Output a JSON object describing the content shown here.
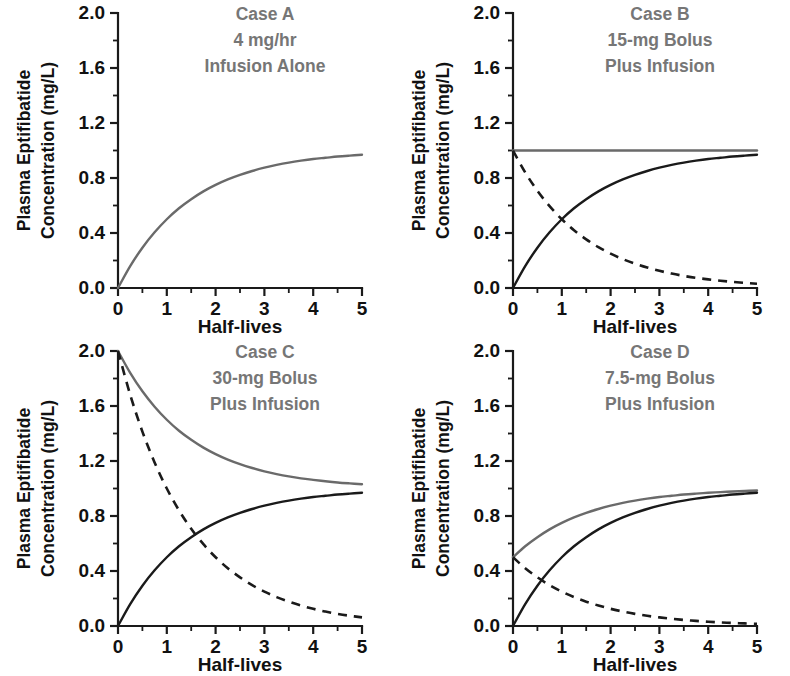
{
  "figure": {
    "width": 790,
    "height": 676,
    "background": "#ffffff",
    "panel_order": [
      "A",
      "B",
      "C",
      "D"
    ]
  },
  "style": {
    "total_color": "#6a6a6a",
    "infusion_color": "#1a1a1a",
    "bolus_color": "#1a1a1a",
    "axis_color": "#1a1a1a",
    "title_color": "#767676",
    "label_color": "#111111"
  },
  "axes": {
    "xlabel": "Half-lives",
    "ylabel_line1": "Plasma Eptifibatide",
    "ylabel_line2": "Concentration (mg/L)",
    "xlim": [
      0,
      5
    ],
    "ylim": [
      0,
      2.0
    ],
    "x_major_ticks": [
      0,
      1,
      2,
      3,
      4,
      5
    ],
    "x_tick_labels": [
      "0",
      "1",
      "2",
      "3",
      "4",
      "5"
    ],
    "x_minor_ticks": [
      0.5,
      1.5,
      2.5,
      3.5,
      4.5
    ],
    "y_major_ticks": [
      0.0,
      0.4,
      0.8,
      1.2,
      1.6,
      2.0
    ],
    "y_tick_labels": [
      "0.0",
      "0.4",
      "0.8",
      "1.2",
      "1.6",
      "2.0"
    ],
    "y_minor_ticks": [
      0.2,
      0.6,
      1.0,
      1.4,
      1.8
    ],
    "grid": false
  },
  "chart_data": [
    {
      "type": "line",
      "panel": "A",
      "title_lines": [
        "Case A",
        "4 mg/hr",
        "Infusion Alone"
      ],
      "xlabel": "Half-lives",
      "ylabel": "Plasma Eptifibatide Concentration (mg/L)",
      "xlim": [
        0,
        5
      ],
      "ylim": [
        0,
        2.0
      ],
      "grid": false,
      "legend": "none",
      "bolus_dose_mg": 0,
      "infusion_rate": "4 mg/hr",
      "steady_state": 1.0,
      "x": [
        0,
        0.25,
        0.5,
        0.75,
        1,
        1.25,
        1.5,
        1.75,
        2,
        2.25,
        2.5,
        2.75,
        3,
        3.25,
        3.5,
        3.75,
        4,
        4.25,
        4.5,
        4.75,
        5
      ],
      "series": [
        {
          "name": "Total plasma concentration",
          "style": "solid-gray",
          "color": "#6a6a6a",
          "values": [
            0.0,
            0.159,
            0.293,
            0.405,
            0.5,
            0.58,
            0.646,
            0.703,
            0.75,
            0.79,
            0.823,
            0.851,
            0.875,
            0.895,
            0.912,
            0.926,
            0.938,
            0.947,
            0.956,
            0.963,
            0.969
          ]
        }
      ]
    },
    {
      "type": "line",
      "panel": "B",
      "title_lines": [
        "Case B",
        "15-mg Bolus",
        "Plus Infusion"
      ],
      "xlabel": "Half-lives",
      "ylabel": "Plasma Eptifibatide Concentration (mg/L)",
      "xlim": [
        0,
        5
      ],
      "ylim": [
        0,
        2.0
      ],
      "grid": false,
      "legend": "none",
      "bolus_dose_mg": 15,
      "infusion_rate": "4 mg/hr",
      "steady_state": 1.0,
      "x": [
        0,
        0.25,
        0.5,
        0.75,
        1,
        1.25,
        1.5,
        1.75,
        2,
        2.25,
        2.5,
        2.75,
        3,
        3.25,
        3.5,
        3.75,
        4,
        4.25,
        4.5,
        4.75,
        5
      ],
      "series": [
        {
          "name": "Total plasma concentration",
          "style": "solid-gray",
          "color": "#6a6a6a",
          "values": [
            1.0,
            1.0,
            1.0,
            1.0,
            1.0,
            1.0,
            1.0,
            1.0,
            1.0,
            1.0,
            1.0,
            1.0,
            1.0,
            1.0,
            1.0,
            1.0,
            1.0,
            1.0,
            1.0,
            1.0,
            1.0
          ]
        },
        {
          "name": "Infusion component",
          "style": "solid-black",
          "color": "#1a1a1a",
          "values": [
            0.0,
            0.159,
            0.293,
            0.405,
            0.5,
            0.58,
            0.646,
            0.703,
            0.75,
            0.79,
            0.823,
            0.851,
            0.875,
            0.895,
            0.912,
            0.926,
            0.938,
            0.947,
            0.956,
            0.963,
            0.969
          ]
        },
        {
          "name": "Bolus component",
          "style": "dashed-black",
          "color": "#1a1a1a",
          "values": [
            1.0,
            0.841,
            0.707,
            0.595,
            0.5,
            0.42,
            0.354,
            0.297,
            0.25,
            0.21,
            0.177,
            0.149,
            0.125,
            0.105,
            0.088,
            0.074,
            0.063,
            0.053,
            0.044,
            0.037,
            0.031
          ]
        }
      ]
    },
    {
      "type": "line",
      "panel": "C",
      "title_lines": [
        "Case C",
        "30-mg Bolus",
        "Plus Infusion"
      ],
      "xlabel": "Half-lives",
      "ylabel": "Plasma Eptifibatide Concentration (mg/L)",
      "xlim": [
        0,
        5
      ],
      "ylim": [
        0,
        2.0
      ],
      "grid": false,
      "legend": "none",
      "bolus_dose_mg": 30,
      "infusion_rate": "4 mg/hr",
      "steady_state": 1.0,
      "x": [
        0,
        0.25,
        0.5,
        0.75,
        1,
        1.25,
        1.5,
        1.75,
        2,
        2.25,
        2.5,
        2.75,
        3,
        3.25,
        3.5,
        3.75,
        4,
        4.25,
        4.5,
        4.75,
        5
      ],
      "series": [
        {
          "name": "Total plasma concentration",
          "style": "solid-gray",
          "color": "#6a6a6a",
          "values": [
            2.0,
            1.841,
            1.707,
            1.595,
            1.5,
            1.42,
            1.354,
            1.297,
            1.25,
            1.21,
            1.177,
            1.149,
            1.125,
            1.105,
            1.088,
            1.074,
            1.063,
            1.053,
            1.044,
            1.037,
            1.031
          ]
        },
        {
          "name": "Infusion component",
          "style": "solid-black",
          "color": "#1a1a1a",
          "values": [
            0.0,
            0.159,
            0.293,
            0.405,
            0.5,
            0.58,
            0.646,
            0.703,
            0.75,
            0.79,
            0.823,
            0.851,
            0.875,
            0.895,
            0.912,
            0.926,
            0.938,
            0.947,
            0.956,
            0.963,
            0.969
          ]
        },
        {
          "name": "Bolus component",
          "style": "dashed-black",
          "color": "#1a1a1a",
          "values": [
            2.0,
            1.682,
            1.414,
            1.189,
            1.0,
            0.841,
            0.707,
            0.595,
            0.5,
            0.42,
            0.354,
            0.297,
            0.25,
            0.21,
            0.177,
            0.149,
            0.125,
            0.105,
            0.088,
            0.074,
            0.063
          ]
        }
      ]
    },
    {
      "type": "line",
      "panel": "D",
      "title_lines": [
        "Case D",
        "7.5-mg Bolus",
        "Plus Infusion"
      ],
      "xlabel": "Half-lives",
      "ylabel": "Plasma Eptifibatide Concentration (mg/L)",
      "xlim": [
        0,
        5
      ],
      "ylim": [
        0,
        2.0
      ],
      "grid": false,
      "legend": "none",
      "bolus_dose_mg": 7.5,
      "infusion_rate": "4 mg/hr",
      "steady_state": 1.0,
      "x": [
        0,
        0.25,
        0.5,
        0.75,
        1,
        1.25,
        1.5,
        1.75,
        2,
        2.25,
        2.5,
        2.75,
        3,
        3.25,
        3.5,
        3.75,
        4,
        4.25,
        4.5,
        4.75,
        5
      ],
      "series": [
        {
          "name": "Total plasma concentration",
          "style": "solid-gray",
          "color": "#6a6a6a",
          "values": [
            0.5,
            0.58,
            0.646,
            0.703,
            0.75,
            0.79,
            0.823,
            0.851,
            0.875,
            0.895,
            0.912,
            0.926,
            0.938,
            0.947,
            0.956,
            0.963,
            0.969,
            0.974,
            0.978,
            0.982,
            0.985
          ]
        },
        {
          "name": "Infusion component",
          "style": "solid-black",
          "color": "#1a1a1a",
          "values": [
            0.0,
            0.159,
            0.293,
            0.405,
            0.5,
            0.58,
            0.646,
            0.703,
            0.75,
            0.79,
            0.823,
            0.851,
            0.875,
            0.895,
            0.912,
            0.926,
            0.938,
            0.947,
            0.956,
            0.963,
            0.969
          ]
        },
        {
          "name": "Bolus component",
          "style": "dashed-black",
          "color": "#1a1a1a",
          "values": [
            0.5,
            0.42,
            0.354,
            0.297,
            0.25,
            0.21,
            0.177,
            0.149,
            0.125,
            0.105,
            0.088,
            0.074,
            0.063,
            0.053,
            0.044,
            0.037,
            0.031,
            0.026,
            0.022,
            0.019,
            0.016
          ]
        }
      ]
    }
  ]
}
